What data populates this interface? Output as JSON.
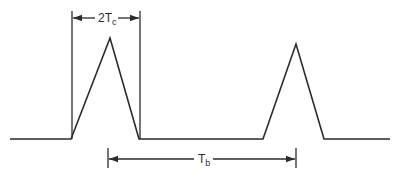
{
  "diagram": {
    "type": "pulse-waveform",
    "labels": {
      "pulse_width": {
        "main": "2T",
        "subscript": "c"
      },
      "period": {
        "main": "T",
        "subscript": "b"
      }
    },
    "colors": {
      "line": "#2b2b2b",
      "background": "#ffffff"
    },
    "geometry": {
      "baseline_y": 139,
      "pulses": [
        {
          "left_foot_x": 71,
          "apex_x": 110,
          "apex_y": 38,
          "right_foot_x": 139
        },
        {
          "left_foot_x": 263,
          "apex_x": 296,
          "apex_y": 44,
          "right_foot_x": 324
        }
      ],
      "baseline_start_x": 10,
      "baseline_end_x": 390,
      "pulse_width_marker": {
        "x1": 72,
        "x2": 140,
        "arrow_y": 18
      },
      "period_marker": {
        "x1": 108,
        "x2": 296,
        "arrow_y": 159
      }
    }
  }
}
